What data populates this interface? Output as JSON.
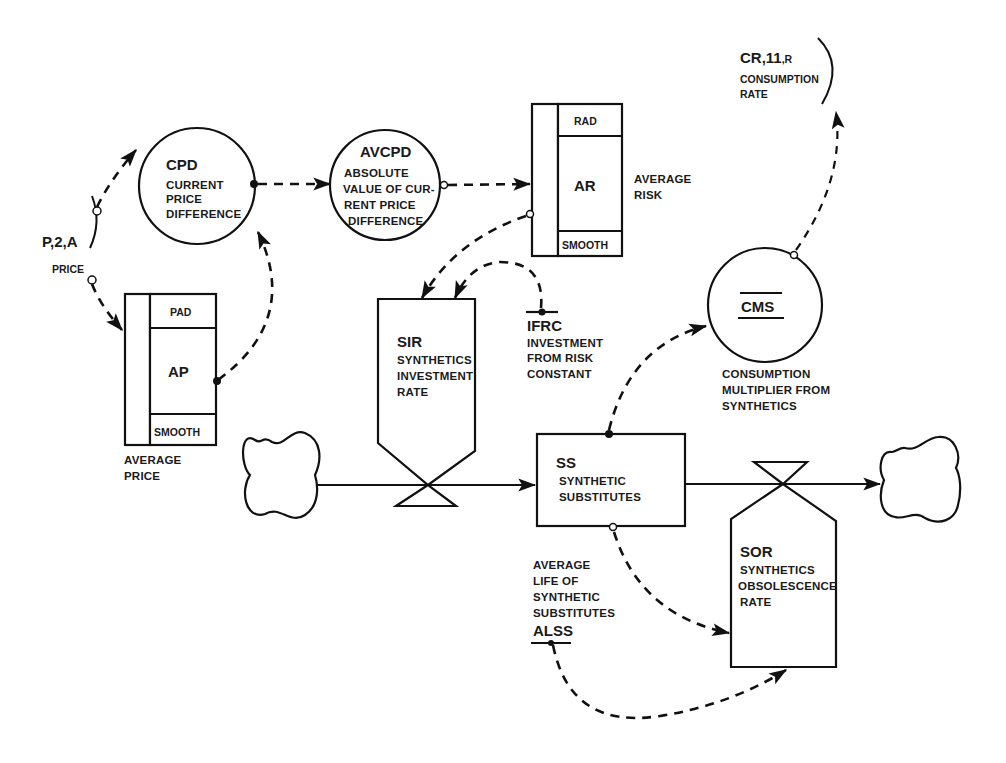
{
  "diagram": {
    "type": "system-dynamics-flow-diagram",
    "nodes": {
      "price": {
        "code": "P,2,A",
        "label": "PRICE",
        "kind": "external-input"
      },
      "cpd": {
        "code": "CPD",
        "lines": [
          "CURRENT",
          "PRICE",
          "DIFFERENCE"
        ],
        "kind": "auxiliary"
      },
      "avcpd": {
        "code": "AVCPD",
        "lines": [
          "ABSOLUTE",
          "VALUE OF CUR-",
          "RENT PRICE",
          "DIFFERENCE"
        ],
        "kind": "auxiliary"
      },
      "ap": {
        "code": "AP",
        "top": "PAD",
        "bottom": "SMOOTH",
        "lines": [
          "AVERAGE",
          "PRICE"
        ],
        "kind": "smooth"
      },
      "ar": {
        "code": "AR",
        "top": "RAD",
        "bottom": "SMOOTH",
        "lines": [
          "AVERAGE",
          "RISK"
        ],
        "kind": "smooth"
      },
      "sir": {
        "code": "SIR",
        "lines": [
          "SYNTHETICS",
          "INVESTMENT",
          "RATE"
        ],
        "kind": "rate"
      },
      "ifrc": {
        "code": "IFRC",
        "lines": [
          "INVESTMENT",
          "FROM RISK",
          "CONSTANT"
        ],
        "kind": "constant"
      },
      "cms": {
        "code": "CMS",
        "lines": [
          "CONSUMPTION",
          "MULTIPLIER FROM",
          "SYNTHETICS"
        ],
        "kind": "auxiliary"
      },
      "cr": {
        "code_a": "CR,",
        "code_b": "11",
        "code_c": ",R",
        "lines": [
          "CONSUMPTION",
          "RATE"
        ],
        "kind": "external-output"
      },
      "ss": {
        "code": "SS",
        "lines": [
          "SYNTHETIC",
          "SUBSTITUTES"
        ],
        "kind": "level"
      },
      "sor": {
        "code": "SOR",
        "lines": [
          "SYNTHETICS",
          "OBSOLESCENCE",
          "RATE"
        ],
        "kind": "rate"
      },
      "alss": {
        "code": "ALSS",
        "lines": [
          "AVERAGE",
          "LIFE OF",
          "SYNTHETIC",
          "SUBSTITUTES"
        ],
        "kind": "constant"
      },
      "source": {
        "kind": "source-cloud"
      },
      "sink": {
        "kind": "sink-cloud"
      }
    },
    "links": [
      {
        "from": "price",
        "to": "cpd",
        "style": "information"
      },
      {
        "from": "price",
        "to": "ap",
        "style": "information"
      },
      {
        "from": "ap",
        "to": "cpd",
        "style": "information"
      },
      {
        "from": "cpd",
        "to": "avcpd",
        "style": "information"
      },
      {
        "from": "avcpd",
        "to": "ar",
        "style": "information"
      },
      {
        "from": "ar",
        "to": "sir",
        "style": "information"
      },
      {
        "from": "ifrc",
        "to": "sir",
        "style": "information"
      },
      {
        "from": "ss",
        "to": "cms",
        "style": "information"
      },
      {
        "from": "cms",
        "to": "cr",
        "style": "information"
      },
      {
        "from": "ss",
        "to": "sor",
        "style": "information"
      },
      {
        "from": "alss",
        "to": "sor",
        "style": "information"
      },
      {
        "from": "source",
        "to": "ss",
        "style": "material",
        "via": "sir"
      },
      {
        "from": "ss",
        "to": "sink",
        "style": "material",
        "via": "sor"
      }
    ]
  }
}
